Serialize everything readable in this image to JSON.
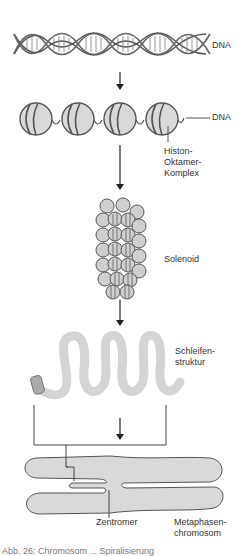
{
  "diagram": {
    "stages": [
      {
        "id": "dna",
        "label": "DNA"
      },
      {
        "id": "nucleosomes",
        "label": "DNA",
        "sublabel_lines": [
          "Histon-",
          "Oktamer-",
          "Komplex"
        ]
      },
      {
        "id": "solenoid",
        "label": "Solenoid"
      },
      {
        "id": "loops",
        "label_lines": [
          "Schleifen-",
          "struktur"
        ]
      },
      {
        "id": "chromosome",
        "label": "Zentromer",
        "sublabel_lines": [
          "Metaphasen-",
          "chromosom"
        ]
      }
    ],
    "colors": {
      "stroke": "#555555",
      "fill_light": "#d9d9d9",
      "loop_fill": "#d4d4d4",
      "arrow": "#222222"
    },
    "caption_cut": "Abb. 26: Chromosom ... Spiralisierung"
  }
}
